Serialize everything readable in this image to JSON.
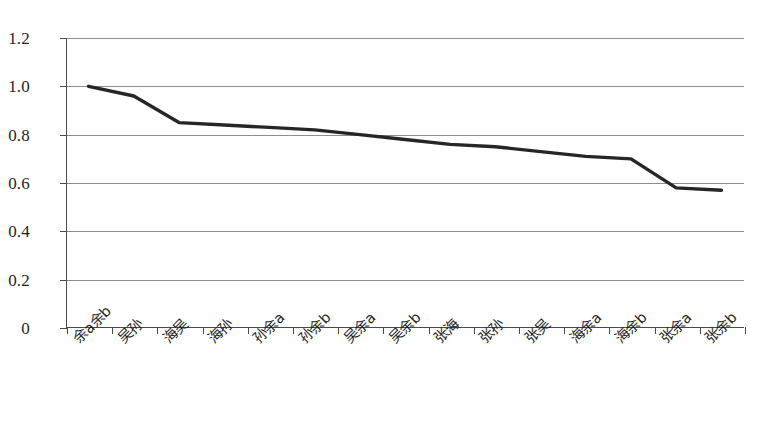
{
  "chart_data": {
    "type": "line",
    "title": "",
    "xlabel": "",
    "ylabel": "",
    "categories": [
      "余a余b",
      "吴孙",
      "海吴",
      "海孙",
      "孙余a",
      "孙余b",
      "吴余a",
      "吴余b",
      "张海",
      "张孙",
      "张吴",
      "海余a",
      "海余b",
      "张余a",
      "张余b"
    ],
    "values": [
      1.0,
      0.96,
      0.85,
      0.84,
      0.83,
      0.82,
      0.8,
      0.78,
      0.76,
      0.75,
      0.73,
      0.71,
      0.7,
      0.58,
      0.57
    ],
    "ylim": [
      0,
      1.2
    ],
    "ytick_labels": [
      "0",
      "0.2",
      "0.4",
      "0.6",
      "0.8",
      "1.0",
      "1.2"
    ],
    "ytick_values": [
      0,
      0.2,
      0.4,
      0.6,
      0.8,
      1.0,
      1.2
    ],
    "grid": true,
    "legend": false,
    "series_color": "#262626",
    "axis_color": "#4a4a4a",
    "grid_color": "#8d8d8d"
  }
}
